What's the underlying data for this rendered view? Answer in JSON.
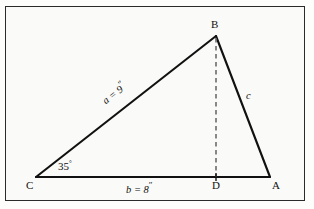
{
  "figure": {
    "type": "geometry-diagram",
    "shape": "triangle",
    "background_color": "#fafaf8",
    "border_color": "#2b2b2b",
    "line_color": "#111111"
  },
  "vertices": {
    "A": {
      "label": "A",
      "x": 270,
      "y": 177
    },
    "B": {
      "label": "B",
      "x": 216,
      "y": 36
    },
    "C": {
      "label": "C",
      "x": 36,
      "y": 177
    },
    "D": {
      "label": "D",
      "x": 216,
      "y": 177
    }
  },
  "sides": {
    "a": {
      "label": "a = 9",
      "unit_mark": "″",
      "from": "C",
      "to": "B",
      "value": 9
    },
    "b": {
      "label": "b = 8",
      "unit_mark": "″",
      "from": "C",
      "to": "A",
      "value": 8
    },
    "c": {
      "label": "c",
      "from": "B",
      "to": "A"
    }
  },
  "angles": {
    "C": {
      "label": "35",
      "degree_mark": "°",
      "value": 35
    }
  },
  "altitude": {
    "name": "BD",
    "style": "dashed",
    "from": "B",
    "to": "D"
  }
}
